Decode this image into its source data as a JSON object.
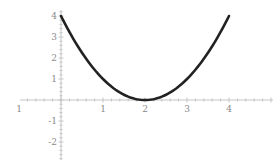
{
  "chart_data": {
    "type": "line",
    "title": "",
    "xlabel": "",
    "ylabel": "",
    "function": "y = (x - 2)^2",
    "xlim": [
      -1,
      5
    ],
    "ylim": [
      -2.5,
      4.2
    ],
    "grid": false,
    "legend": null,
    "x_tick_labels": [
      "1",
      "1",
      "2",
      "3",
      "4"
    ],
    "x_tick_values": [
      -1,
      1,
      2,
      3,
      4
    ],
    "y_tick_labels": [
      "4",
      "3",
      "2",
      "1",
      "-1",
      "-2"
    ],
    "y_tick_values": [
      4,
      3,
      2,
      1,
      -1,
      -2
    ],
    "series": [
      {
        "name": "(x-2)^2",
        "color": "#222222",
        "x": [
          0,
          0.25,
          0.5,
          0.75,
          1,
          1.25,
          1.5,
          1.75,
          2,
          2.25,
          2.5,
          2.75,
          3,
          3.25,
          3.5,
          3.75,
          4
        ],
        "y": [
          4,
          3.0625,
          2.25,
          1.5625,
          1,
          0.5625,
          0.25,
          0.0625,
          0,
          0.0625,
          0.25,
          0.5625,
          1,
          1.5625,
          2.25,
          3.0625,
          4
        ]
      }
    ]
  }
}
